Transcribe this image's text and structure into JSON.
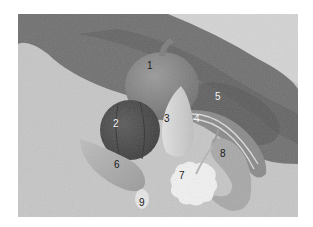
{
  "image": {
    "description": "Grayscale photograph of nine squashes and gourds arranged on sandy ground beside a strip of grass, each marked with a number",
    "colors": {
      "background": "#ffffff",
      "ground": "#c9c9c9",
      "grass": "#6e6e6e"
    }
  },
  "labels": [
    {
      "id": "1",
      "text": "1",
      "subject": "large round pumpkin"
    },
    {
      "id": "2",
      "text": "2",
      "subject": "dark ribbed squash"
    },
    {
      "id": "3",
      "text": "3",
      "subject": "pale elongated squash"
    },
    {
      "id": "4",
      "text": "4",
      "subject": "striped long gourd"
    },
    {
      "id": "5",
      "text": "5",
      "subject": "dark grass strip"
    },
    {
      "id": "6",
      "text": "6",
      "subject": "pear-shaped squash"
    },
    {
      "id": "7",
      "text": "7",
      "subject": "white scalloped pattypan squash"
    },
    {
      "id": "8",
      "text": "8",
      "subject": "crookneck squash"
    },
    {
      "id": "9",
      "text": "9",
      "subject": "small white egg gourd"
    }
  ]
}
